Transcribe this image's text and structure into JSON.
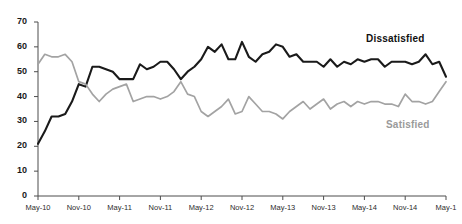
{
  "chart_data": {
    "type": "line",
    "title": "",
    "subtitle": "",
    "xlabel": "",
    "ylabel": "",
    "ylim": [
      0,
      70
    ],
    "ytick_values": [
      0,
      10,
      20,
      30,
      40,
      50,
      60,
      70
    ],
    "ytick_labels": [
      "0",
      "10",
      "20",
      "30",
      "40",
      "50",
      "60",
      "70"
    ],
    "grid": false,
    "legend_position": "inline-annotation",
    "x_axis_type": "monthly",
    "x_start": "May-10",
    "x_end": "May-15",
    "xtick_labels": [
      "May-10",
      "Nov-10",
      "May-11",
      "Nov-11",
      "May-12",
      "Nov-12",
      "May-13",
      "Nov-13",
      "May-14",
      "Nov-14",
      "May-1"
    ],
    "xtick_index": [
      0,
      6,
      12,
      18,
      24,
      30,
      36,
      42,
      48,
      54,
      60
    ],
    "x": [
      "May-10",
      "Jun-10",
      "Jul-10",
      "Aug-10",
      "Sep-10",
      "Oct-10",
      "Nov-10",
      "Dec-10",
      "Jan-11",
      "Feb-11",
      "Mar-11",
      "Apr-11",
      "May-11",
      "Jun-11",
      "Jul-11",
      "Aug-11",
      "Sep-11",
      "Oct-11",
      "Nov-11",
      "Dec-11",
      "Jan-12",
      "Feb-12",
      "Mar-12",
      "Apr-12",
      "May-12",
      "Jun-12",
      "Jul-12",
      "Aug-12",
      "Sep-12",
      "Oct-12",
      "Nov-12",
      "Dec-12",
      "Jan-13",
      "Feb-13",
      "Mar-13",
      "Apr-13",
      "May-13",
      "Jun-13",
      "Jul-13",
      "Aug-13",
      "Sep-13",
      "Oct-13",
      "Nov-13",
      "Dec-13",
      "Jan-14",
      "Feb-14",
      "Mar-14",
      "Apr-14",
      "May-14",
      "Jun-14",
      "Jul-14",
      "Aug-14",
      "Sep-14",
      "Oct-14",
      "Nov-14",
      "Dec-14",
      "Jan-15",
      "Feb-15",
      "Mar-15",
      "Apr-15",
      "May-15"
    ],
    "series": [
      {
        "name": "Dissatisfied",
        "color": "#1a1a1a",
        "label_position": {
          "x": 366,
          "y": 33
        },
        "values": [
          21,
          26,
          32,
          32,
          33,
          38,
          45,
          44,
          52,
          52,
          51,
          50,
          47,
          47,
          47,
          53,
          51,
          52,
          54,
          54,
          51,
          47,
          50,
          52,
          55,
          60,
          58,
          61,
          55,
          55,
          62,
          56,
          54,
          57,
          58,
          61,
          60,
          56,
          57,
          54,
          54,
          54,
          52,
          55,
          52,
          54,
          53,
          55,
          54,
          55,
          55,
          52,
          54,
          54,
          54,
          53,
          54,
          57,
          53,
          54,
          48
        ]
      },
      {
        "name": "Satisfied",
        "color": "#a3a3a3",
        "label_position": {
          "x": 386,
          "y": 119
        },
        "values": [
          53,
          57,
          56,
          56,
          57,
          54,
          46,
          45,
          41,
          38,
          41,
          43,
          44,
          45,
          38,
          39,
          40,
          40,
          39,
          40,
          42,
          46,
          41,
          40,
          34,
          32,
          34,
          36,
          39,
          33,
          34,
          40,
          37,
          34,
          34,
          33,
          31,
          34,
          36,
          38,
          35,
          37,
          39,
          35,
          37,
          38,
          36,
          38,
          37,
          38,
          38,
          37,
          37,
          36,
          41,
          38,
          38,
          37,
          38,
          42,
          46
        ]
      }
    ]
  },
  "labels": {
    "dissatisfied": "Dissatisfied",
    "satisfied": "Satisfied"
  }
}
